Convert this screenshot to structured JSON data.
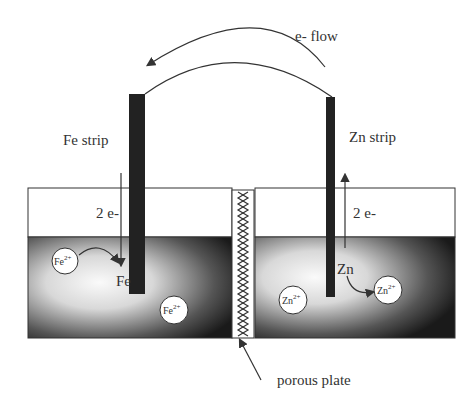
{
  "diagram": {
    "labels": {
      "electron_flow": "e- flow",
      "fe_strip": "Fe strip",
      "zn_strip": "Zn strip",
      "left_electrons": "2 e-",
      "right_electrons": "2 e-",
      "fe_atom": "Fe",
      "zn_atom": "Zn",
      "porous_plate": "porous plate"
    },
    "ions": {
      "left_ion_1": {
        "base": "Fe",
        "charge": "2+"
      },
      "left_ion_2": {
        "base": "Fe",
        "charge": "2+"
      },
      "right_ion_1": {
        "base": "Zn",
        "charge": "2+"
      },
      "right_ion_2": {
        "base": "Zn",
        "charge": "2+"
      }
    },
    "colors": {
      "strip": "#222222",
      "line": "#333333",
      "solution_dark": "#1a1a1a",
      "solution_light": "#f4f4f4"
    }
  }
}
